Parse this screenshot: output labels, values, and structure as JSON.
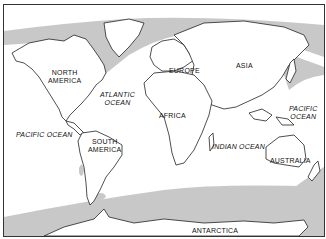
{
  "map": {
    "type": "world map",
    "colors": {
      "land": "#ffffff",
      "coastline": "#222222",
      "shaded_water": "#c8c8c8",
      "ocean": "#ffffff",
      "frame": "#333333"
    },
    "continents": [
      {
        "name": "NORTH AMERICA",
        "line1": "NORTH",
        "line2": "AMERICA"
      },
      {
        "name": "SOUTH AMERICA",
        "line1": "SOUTH",
        "line2": "AMERICA"
      },
      {
        "name": "EUROPE"
      },
      {
        "name": "ASIA"
      },
      {
        "name": "AFRICA"
      },
      {
        "name": "AUSTRALIA"
      },
      {
        "name": "ANTARCTICA"
      }
    ],
    "oceans": [
      {
        "name": "ATLANTIC OCEAN",
        "line1": "ATLANTIC",
        "line2": "OCEAN"
      },
      {
        "name": "PACIFIC OCEAN",
        "label": "PACIFIC OCEAN"
      },
      {
        "name": "PACIFIC OCEAN",
        "line1": "PACIFIC",
        "line2": "OCEAN"
      },
      {
        "name": "INDIAN OCEAN",
        "label": "INDIAN OCEAN"
      }
    ]
  }
}
